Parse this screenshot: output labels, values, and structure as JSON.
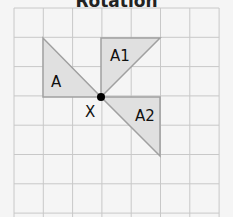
{
  "title": "Rotation",
  "grid": {
    "origin_x": 14,
    "origin_y": 8,
    "cell": 29.3,
    "cols": 7,
    "rows": 7,
    "line_color": "#c8c8c8",
    "background": "#f5f5f5"
  },
  "center": {
    "label": "X",
    "grid_x": 3,
    "grid_y": 3
  },
  "shapes": [
    {
      "label": "A",
      "fill": "#e0e0e0",
      "stroke": "#a0a0a0",
      "grid_points": [
        [
          1,
          1
        ],
        [
          1,
          3
        ],
        [
          3,
          3
        ]
      ]
    },
    {
      "label": "A1",
      "fill": "#e0e0e0",
      "stroke": "#a0a0a0",
      "grid_points": [
        [
          3,
          1
        ],
        [
          5,
          1
        ],
        [
          3,
          3
        ]
      ]
    },
    {
      "label": "A2",
      "fill": "#e0e0e0",
      "stroke": "#a0a0a0",
      "grid_points": [
        [
          3,
          3
        ],
        [
          5,
          3
        ],
        [
          5,
          5
        ]
      ]
    }
  ],
  "labels": {
    "a": "A",
    "a1": "A1",
    "a2": "A2",
    "x": "X"
  }
}
